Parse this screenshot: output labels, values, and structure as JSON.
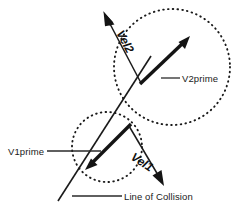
{
  "diagram": {
    "background_color": "#ffffff",
    "stroke_color": "#1a1a1a",
    "labels": {
      "vel2": "Vel2",
      "vel1": "Vel1",
      "v2prime": "V2prime",
      "v1prime": "V1prime",
      "line_of_collision": "Line of Collision"
    },
    "bodies": [
      {
        "name": "upper-body",
        "shape": "dotted-circle",
        "center_x": 172,
        "center_y": 67,
        "radius": 58
      },
      {
        "name": "lower-body",
        "shape": "dotted-circle",
        "center_x": 107,
        "center_y": 147,
        "radius": 35
      }
    ],
    "vectors": [
      {
        "name": "vel2-vector",
        "label": "Vel2",
        "style": "thin",
        "from_x": 141,
        "from_y": 83,
        "to_x": 104,
        "to_y": 13
      },
      {
        "name": "v2prime-vector",
        "label": "V2prime",
        "style": "thick",
        "from_x": 140,
        "from_y": 84,
        "to_x": 189,
        "to_y": 37
      },
      {
        "name": "v1prime-vector",
        "label": "V1prime",
        "style": "thick",
        "from_x": 131,
        "from_y": 124,
        "to_x": 87,
        "to_y": 168
      },
      {
        "name": "vel1-vector",
        "label": "Vel1",
        "style": "thin",
        "from_x": 129,
        "from_y": 126,
        "to_x": 163,
        "to_y": 184
      }
    ],
    "collision_axis": {
      "name": "line-of-collision",
      "from_x": 58,
      "from_y": 201,
      "to_x": 151,
      "to_y": 56
    }
  }
}
